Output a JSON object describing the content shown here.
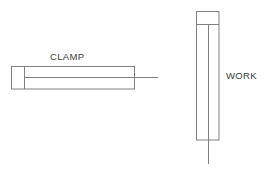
{
  "diagram": {
    "background_color": "#ffffff",
    "line_color": "#808080",
    "text_color": "#3a3a3a",
    "labels": {
      "clamp": "CLAMP",
      "work": "WORK"
    },
    "parts": [
      {
        "name": "clamp",
        "label": "CLAMP",
        "orientation": "horizontal",
        "outer_rect": {
          "x": 11,
          "y": 66,
          "width": 124,
          "height": 23
        },
        "jaw_divider_x": 24,
        "inner_line_y": 77,
        "centerline": {
          "x1": 135,
          "y1": 77,
          "x2": 158,
          "y2": 77
        }
      },
      {
        "name": "work",
        "label": "WORK",
        "orientation": "vertical",
        "outer_rect": {
          "x": 196,
          "y": 11,
          "width": 23,
          "height": 129
        },
        "cap_divider_y": 24,
        "inner_line_x": 209,
        "centerline": {
          "x1": 209,
          "y1": 140,
          "x2": 209,
          "y2": 164
        }
      }
    ]
  }
}
